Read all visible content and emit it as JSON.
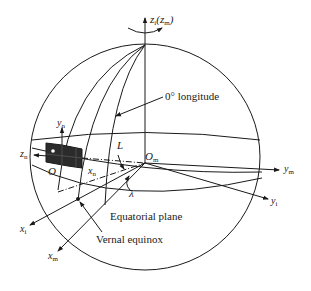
{
  "diagram": {
    "labels": {
      "z_axis": {
        "main": "z",
        "sub": "i",
        "paren_main": "z",
        "paren_sub": "m"
      },
      "zero_longitude": "0° longitude",
      "y_n": {
        "main": "y",
        "sub": "n"
      },
      "z_n": {
        "main": "z",
        "sub": "n"
      },
      "origin_O": "O",
      "x_n": {
        "main": "x",
        "sub": "n"
      },
      "L": "L",
      "O_m": {
        "main": "O",
        "sub": "m"
      },
      "y_m": {
        "main": "y",
        "sub": "m"
      },
      "y_i": {
        "main": "y",
        "sub": "i"
      },
      "lambda": "λ",
      "equatorial_plane": "Equatorial plane",
      "x_i": {
        "main": "x",
        "sub": "i"
      },
      "x_m": {
        "main": "x",
        "sub": "m"
      },
      "vernal_equinox": "Vernal equinox"
    },
    "colors": {
      "line": "#1a1a1a",
      "box_fill": "#2b2b2b",
      "background": "#ffffff"
    }
  }
}
